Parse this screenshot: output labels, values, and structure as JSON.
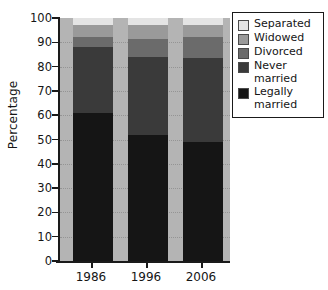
{
  "chart_data": {
    "type": "bar",
    "subtype": "stacked-percentage",
    "title": "",
    "xlabel": "",
    "ylabel": "Percentage",
    "ylim": [
      0,
      100
    ],
    "ytick_labels": [
      "0",
      "10",
      "20",
      "30",
      "40",
      "50",
      "60",
      "70",
      "80",
      "90",
      "100"
    ],
    "ytick_values": [
      0,
      10,
      20,
      30,
      40,
      50,
      60,
      70,
      80,
      90,
      100
    ],
    "grid": true,
    "grid_style": "dotted horizontal",
    "legend_position": "right",
    "categories": [
      "1986",
      "1996",
      "2006"
    ],
    "series": [
      {
        "name": "Legally married",
        "color": "#151515",
        "values": [
          61,
          52,
          49
        ]
      },
      {
        "name": "Never married",
        "color": "#3a3a3a",
        "values": [
          27,
          32,
          34.5
        ]
      },
      {
        "name": "Divorced",
        "color": "#6b6b6b",
        "values": [
          4,
          7.5,
          8.5
        ]
      },
      {
        "name": "Widowed",
        "color": "#9a9a9a",
        "values": [
          5,
          5.5,
          5
        ]
      },
      {
        "name": "Separated",
        "color": "#e4e4e4",
        "values": [
          3,
          3,
          3
        ]
      }
    ],
    "legend_order_top_to_bottom": [
      "Separated",
      "Widowed",
      "Divorced",
      "Never married",
      "Legally married"
    ],
    "plot_background": "#b4b4b4",
    "figure_background": "#ffffff",
    "axis_color": "#1a1a1a"
  },
  "legend": {
    "items": [
      {
        "label": "Separated",
        "color": "#e4e4e4"
      },
      {
        "label": "Widowed",
        "color": "#9a9a9a"
      },
      {
        "label": "Divorced",
        "color": "#6b6b6b"
      },
      {
        "label": "Never\nmarried",
        "color": "#3a3a3a"
      },
      {
        "label": "Legally\nmarried",
        "color": "#151515"
      }
    ]
  }
}
